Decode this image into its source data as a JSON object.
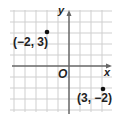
{
  "diagram": {
    "type": "coordinate-plane",
    "axes": {
      "x_label": "x",
      "y_label": "y",
      "origin_label": "O"
    },
    "grid": {
      "x_range": [
        -5,
        4
      ],
      "y_range": [
        -4,
        5
      ]
    },
    "points": [
      {
        "x": -2,
        "y": 3,
        "label": "(−2, 3)"
      },
      {
        "x": 3,
        "y": -2,
        "label": "(3, −2)"
      }
    ],
    "colors": {
      "grid": "#c8c8c8",
      "axis": "#555555",
      "point": "#111111",
      "text": "#222222"
    }
  }
}
